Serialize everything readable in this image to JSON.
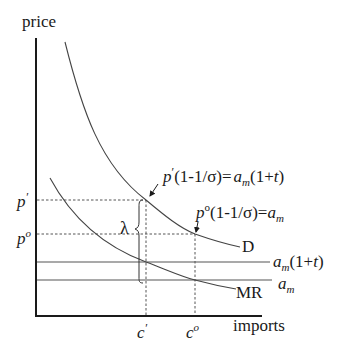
{
  "axes": {
    "y_label": "price",
    "x_label": "imports"
  },
  "curves": {
    "demand_label": "D",
    "mr_label": "MR"
  },
  "horizontal_lines": {
    "tariff_cost": {
      "base": "a",
      "sub": "m",
      "tail": "(1+",
      "t": "t",
      "close": ")"
    },
    "cost": {
      "base": "a",
      "sub": "m"
    }
  },
  "price_ticks": {
    "p_prime": {
      "base": "p",
      "mark": "′"
    },
    "p_zero": {
      "base": "p",
      "mark": "o"
    }
  },
  "quantity_ticks": {
    "c_prime": {
      "base": "c",
      "mark": "′"
    },
    "c_zero": {
      "base": "c",
      "mark": "o"
    }
  },
  "annotations": {
    "lambda": "λ",
    "eq_tariff": {
      "p": "p",
      "mark": "′",
      "mid": "(1-1/σ)=",
      "a": "a",
      "sub": "m",
      "tail": "(1+",
      "t": "t",
      "close": ")"
    },
    "eq_free": {
      "p": "p",
      "mark": "o",
      "mid": "(1-1/σ)=",
      "a": "a",
      "sub": "m"
    }
  },
  "colors": {
    "axis": "#1a1a1a",
    "curve": "#444444",
    "hline": "#555555",
    "dashed": "#555555"
  }
}
